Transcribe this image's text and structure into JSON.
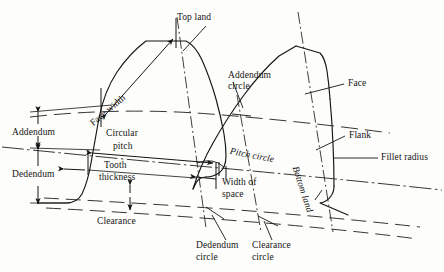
{
  "figure": {
    "kind": "gear-tooth-nomenclature-diagram",
    "background_color": "#fdfdfb",
    "line_color": "#141414",
    "text_color": "#141414",
    "width": 444,
    "height": 272
  },
  "labels": {
    "top_land": "Top land",
    "face_width": "Face width",
    "addendum_circle": "Addendum\ncircle",
    "addendum_circle_l1": "Addendum",
    "addendum_circle_l2": "circle",
    "face": "Face",
    "flank": "Flank",
    "fillet_radius": "Fillet radius",
    "addendum": "Addendum",
    "dedendum": "Dedendum",
    "circular_pitch_l1": "Circular",
    "circular_pitch_l2": "pitch",
    "tooth_thickness_l1": "Tooth",
    "tooth_thickness_l2": "thickness",
    "clearance": "Clearance",
    "pitch_circle": "Pitch circle",
    "width_of_space_l1": "Width of",
    "width_of_space_l2": "space",
    "bottom_land": "Bottom land",
    "dedendum_circle_l1": "Dedendum",
    "dedendum_circle_l2": "circle",
    "clearance_circle_l1": "Clearance",
    "clearance_circle_l2": "circle"
  }
}
